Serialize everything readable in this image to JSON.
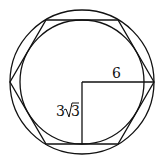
{
  "diagram": {
    "labels": {
      "radius": "6",
      "apothem_coef": "3",
      "apothem_radicand": "3"
    },
    "stroke_color": "#111111"
  }
}
